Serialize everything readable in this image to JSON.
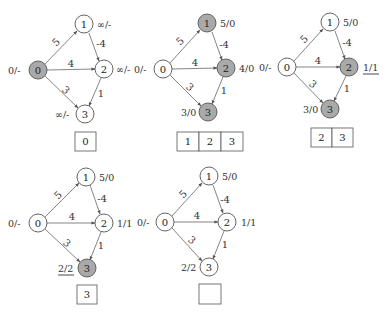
{
  "colors": {
    "active_fill": "#a9a9a9",
    "inactive_fill": "#ffffff",
    "stroke": "#555555",
    "edge": "#666666"
  },
  "edges": [
    {
      "from": "0",
      "to": "1",
      "weight": "5"
    },
    {
      "from": "1",
      "to": "2",
      "weight": "-4"
    },
    {
      "from": "0",
      "to": "2",
      "weight": "4"
    },
    {
      "from": "0",
      "to": "3",
      "weight": "3"
    },
    {
      "from": "2",
      "to": "3",
      "weight": "1"
    }
  ],
  "panels": [
    {
      "nodes": [
        {
          "id": "0",
          "label": "0",
          "dist": "0/-",
          "active": true,
          "underlined": false
        },
        {
          "id": "1",
          "label": "1",
          "dist": "∞/-",
          "active": false,
          "underlined": false
        },
        {
          "id": "2",
          "label": "2",
          "dist": "∞/-",
          "active": false,
          "underlined": false
        },
        {
          "id": "3",
          "label": "3",
          "dist": "∞/-",
          "active": false,
          "underlined": false
        }
      ],
      "queue": [
        "0"
      ]
    },
    {
      "nodes": [
        {
          "id": "0",
          "label": "0",
          "dist": "0/-",
          "active": false,
          "underlined": false
        },
        {
          "id": "1",
          "label": "1",
          "dist": "5/0",
          "active": true,
          "underlined": false
        },
        {
          "id": "2",
          "label": "2",
          "dist": "4/0",
          "active": true,
          "underlined": false
        },
        {
          "id": "3",
          "label": "3",
          "dist": "3/0",
          "active": true,
          "underlined": false
        }
      ],
      "queue": [
        "1",
        "2",
        "3"
      ]
    },
    {
      "nodes": [
        {
          "id": "0",
          "label": "0",
          "dist": "0/-",
          "active": false,
          "underlined": false
        },
        {
          "id": "1",
          "label": "1",
          "dist": "5/0",
          "active": false,
          "underlined": false
        },
        {
          "id": "2",
          "label": "2",
          "dist": "1/1",
          "active": true,
          "underlined": true
        },
        {
          "id": "3",
          "label": "3",
          "dist": "3/0",
          "active": true,
          "underlined": false
        }
      ],
      "queue": [
        "2",
        "3"
      ]
    },
    {
      "nodes": [
        {
          "id": "0",
          "label": "0",
          "dist": "0/-",
          "active": false,
          "underlined": false
        },
        {
          "id": "1",
          "label": "1",
          "dist": "5/0",
          "active": false,
          "underlined": false
        },
        {
          "id": "2",
          "label": "2",
          "dist": "1/1",
          "active": false,
          "underlined": false
        },
        {
          "id": "3",
          "label": "3",
          "dist": "2/2",
          "active": true,
          "underlined": true
        }
      ],
      "queue": [
        "3"
      ]
    },
    {
      "nodes": [
        {
          "id": "0",
          "label": "0",
          "dist": "0/-",
          "active": false,
          "underlined": false
        },
        {
          "id": "1",
          "label": "1",
          "dist": "5/0",
          "active": false,
          "underlined": false
        },
        {
          "id": "2",
          "label": "2",
          "dist": "1/1",
          "active": false,
          "underlined": false
        },
        {
          "id": "3",
          "label": "3",
          "dist": "2/2",
          "active": false,
          "underlined": false
        }
      ],
      "queue": []
    }
  ]
}
